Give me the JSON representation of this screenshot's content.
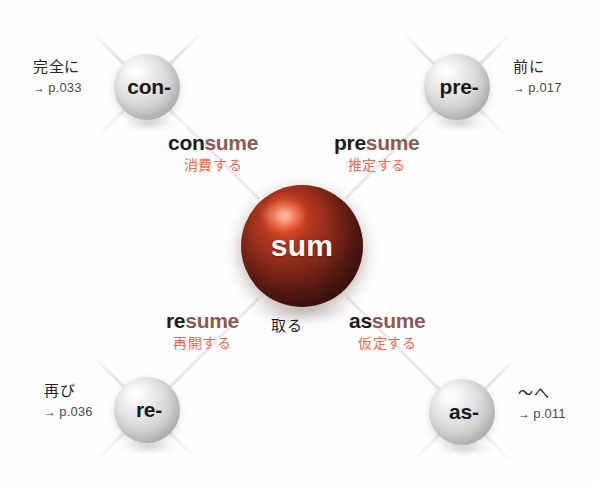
{
  "diagram": {
    "type": "word-root-mind-map",
    "root": {
      "label": "sum",
      "meaning_jp": "取る",
      "color": "#8a2b1b"
    },
    "prefixes": [
      {
        "id": "con",
        "label": "con-",
        "meaning_jp": "完全に",
        "page_arrow": "→",
        "page_ref": "p.033",
        "position": "top-left"
      },
      {
        "id": "pre",
        "label": "pre-",
        "meaning_jp": "前に",
        "page_arrow": "→",
        "page_ref": "p.017",
        "position": "top-right"
      },
      {
        "id": "re",
        "label": "re-",
        "meaning_jp": "再び",
        "page_arrow": "→",
        "page_ref": "p.036",
        "position": "bottom-left"
      },
      {
        "id": "as",
        "label": "as-",
        "meaning_jp": "〜へ",
        "page_arrow": "→",
        "page_ref": "p.011",
        "position": "bottom-right"
      }
    ],
    "words": [
      {
        "id": "consume",
        "prefix_part": "con",
        "stem_part": "sume",
        "meaning_jp": "消費する",
        "position": "upper-left"
      },
      {
        "id": "presume",
        "prefix_part": "pre",
        "stem_part": "sume",
        "meaning_jp": "推定する",
        "position": "upper-right"
      },
      {
        "id": "resume",
        "prefix_part": "re",
        "stem_part": "sume",
        "meaning_jp": "再開する",
        "position": "lower-left"
      },
      {
        "id": "assume",
        "prefix_part": "as",
        "stem_part": "sume",
        "meaning_jp": "仮定する",
        "position": "lower-right"
      }
    ],
    "colors": {
      "root_sphere": "#8a2b1b",
      "prefix_sphere": "#cfcfcf",
      "stem_text": "#8b5a55",
      "prefix_text": "#1c1c1c",
      "translation_text": "#f06a53",
      "background": "#ffffff",
      "ray": "#e6e6e6"
    }
  }
}
